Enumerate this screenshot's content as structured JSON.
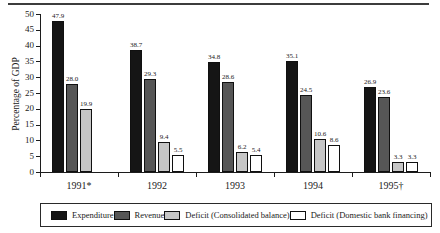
{
  "chart_data": {
    "type": "bar",
    "title": "",
    "xlabel": "",
    "ylabel": "Percentage of GDP",
    "ylim": [
      0,
      50
    ],
    "ytick_step": 5,
    "grid": false,
    "legend_position": "bottom",
    "value_labels_decimals": 1,
    "categories": [
      "1991*",
      "1992",
      "1993",
      "1994",
      "1995†"
    ],
    "series": [
      {
        "name": "Expenditure",
        "color": "#151515",
        "values": [
          47.9,
          38.7,
          34.8,
          35.1,
          26.9
        ]
      },
      {
        "name": "Revenue",
        "color": "#565656",
        "values": [
          28.0,
          29.3,
          28.6,
          24.5,
          23.6
        ]
      },
      {
        "name": "Deficit (Consolidated balance)",
        "color": "#c6c6c6",
        "values": [
          19.9,
          9.4,
          6.2,
          10.6,
          3.3
        ]
      },
      {
        "name": "Deficit (Domestic bank financing)",
        "color": "#ffffff",
        "values": [
          null,
          5.5,
          5.4,
          8.6,
          3.3
        ]
      }
    ]
  }
}
